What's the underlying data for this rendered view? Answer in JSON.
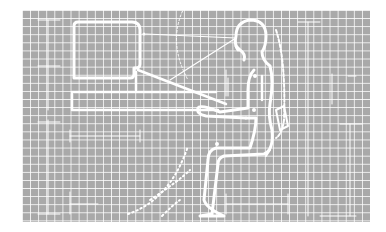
{
  "figure": {
    "background": {
      "fill": "#a9a9a9",
      "grid_color": "#ffffff",
      "grid_spacing_px": 8
    },
    "elements": [
      {
        "name": "monitor",
        "shape": "rounded-rect"
      },
      {
        "name": "desk",
        "shape": "rect-outline"
      },
      {
        "name": "keyboard",
        "shape": "angled-bar"
      },
      {
        "name": "person",
        "shape": "seated-silhouette-outline"
      },
      {
        "name": "chair-backrest",
        "shape": "curved-outline"
      },
      {
        "name": "line-of-sight",
        "shape": "lines"
      },
      {
        "name": "leg-movement-arcs",
        "shape": "dotted-arcs"
      },
      {
        "name": "dimension-lines",
        "shape": "lines-with-ticks"
      }
    ],
    "line_color": "#ffffff"
  }
}
